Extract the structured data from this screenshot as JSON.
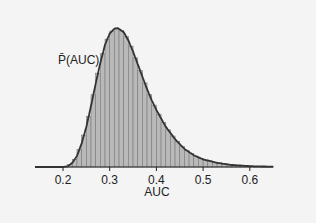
{
  "chart_data": {
    "type": "area",
    "title": "",
    "xlabel": "AUC",
    "ylabel": "",
    "xlim": [
      0.14,
      0.65
    ],
    "xticks": [
      0.2,
      0.3,
      0.4,
      0.5,
      0.6
    ],
    "xtick_labels": [
      "0.2",
      "0.3",
      "0.4",
      "0.5",
      "0.6"
    ],
    "grid": false,
    "legend": null,
    "annotations": [
      {
        "text": "P̄(AUC)",
        "x": 0.26,
        "y_rel": 0.77
      }
    ],
    "series": [
      {
        "name": "P̄(AUC)",
        "style": "histogram with overlaid density curve",
        "x": [
          0.14,
          0.18,
          0.2,
          0.21,
          0.22,
          0.23,
          0.24,
          0.25,
          0.26,
          0.27,
          0.28,
          0.29,
          0.3,
          0.31,
          0.317,
          0.33,
          0.34,
          0.35,
          0.36,
          0.37,
          0.38,
          0.39,
          0.4,
          0.42,
          0.44,
          0.46,
          0.48,
          0.5,
          0.53,
          0.56,
          0.6,
          0.65
        ],
        "y_rel": [
          0.0,
          0.0,
          0.0,
          0.005,
          0.03,
          0.08,
          0.17,
          0.29,
          0.44,
          0.6,
          0.75,
          0.88,
          0.96,
          0.995,
          1.0,
          0.97,
          0.91,
          0.83,
          0.74,
          0.65,
          0.56,
          0.48,
          0.41,
          0.29,
          0.2,
          0.13,
          0.085,
          0.055,
          0.03,
          0.015,
          0.006,
          0.002
        ]
      }
    ]
  }
}
